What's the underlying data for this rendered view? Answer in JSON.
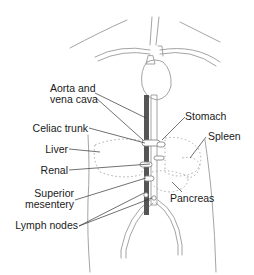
{
  "diagram": {
    "type": "anatomical-illustration",
    "colors": {
      "outline": "#9a9a9a",
      "vessel_dark": "#555555",
      "text": "#1a1a1a",
      "dotted": "#aaaaaa"
    },
    "labels": {
      "aorta": {
        "line1": "Aorta and",
        "line2": "vena cava"
      },
      "celiac": "Celiac trunk",
      "liver": "Liver",
      "renal": "Renal",
      "superior": {
        "line1": "Superior",
        "line2": "mesentery"
      },
      "lymph": "Lymph nodes",
      "stomach": "Stomach",
      "spleen": "Spleen",
      "pancreas": "Pancreas"
    }
  }
}
